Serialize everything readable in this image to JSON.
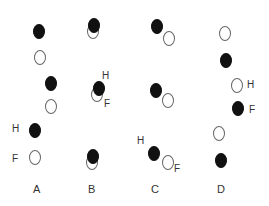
{
  "diagram": {
    "options": [
      {
        "label": "A",
        "label_pos": [
          33,
          184
        ]
      },
      {
        "label": "B",
        "label_pos": [
          88,
          184
        ]
      },
      {
        "label": "C",
        "label_pos": [
          151,
          184
        ]
      },
      {
        "label": "D",
        "label_pos": [
          217,
          184
        ]
      }
    ],
    "markers": {
      "H": "H",
      "F": "F"
    },
    "colors": {
      "filled": "#111111",
      "open_stroke": "#666666"
    }
  }
}
